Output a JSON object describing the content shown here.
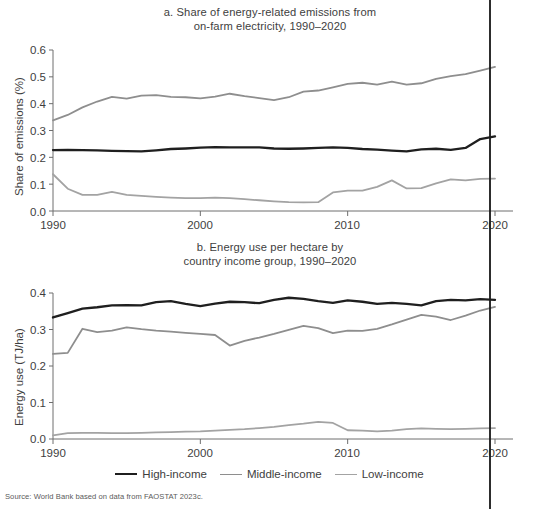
{
  "figure": {
    "source_note": "Source: World Bank based on data from FAOSTAT 2023c.",
    "colors": {
      "high_income": "#1f1f1f",
      "middle_income": "#8e8e8e",
      "low_income": "#a3a3a3",
      "axis": "#6e6e6e",
      "text": "#3e3e3e",
      "background": "#ffffff"
    }
  },
  "legend": {
    "position": "bottom-center",
    "items": [
      {
        "label": "High-income",
        "color": "#1f1f1f"
      },
      {
        "label": "Middle-income",
        "color": "#8e8e8e"
      },
      {
        "label": "Low-income",
        "color": "#a3a3a3"
      }
    ]
  },
  "panel_a": {
    "title_line1": "a. Share of energy-related emissions from",
    "title_line2": "on-farm electricity, 1990–2020",
    "ylabel": "Share of emissions (%)",
    "yticks": [
      "0.6",
      "0.5",
      "0.4",
      "0.3",
      "0.2",
      "0.1",
      "0.0"
    ],
    "xticks": [
      "1990",
      "2000",
      "2010",
      "2020"
    ]
  },
  "panel_b": {
    "title_line1": "b. Energy use per hectare by",
    "title_line2": "country income group, 1990–2020",
    "ylabel": "Energy use (TJ/ha)",
    "yticks": [
      "0.4",
      "0.3",
      "0.2",
      "0.1",
      "0.0"
    ],
    "xticks": [
      "1990",
      "2000",
      "2010",
      "2020"
    ]
  },
  "chart_data": [
    {
      "id": "panel_a",
      "type": "line",
      "title": "a. Share of energy-related emissions from on-farm electricity, 1990–2020",
      "xlabel": "",
      "ylabel": "Share of emissions (%)",
      "xlim": [
        1990,
        2020
      ],
      "ylim": [
        0.0,
        0.6
      ],
      "ytick_values": [
        0.0,
        0.1,
        0.2,
        0.3,
        0.4,
        0.5,
        0.6
      ],
      "xtick_values": [
        1990,
        2000,
        2010,
        2020
      ],
      "grid": false,
      "legend": "bottom-center (shared)",
      "x": [
        1990,
        1991,
        1992,
        1993,
        1994,
        1995,
        1996,
        1997,
        1998,
        1999,
        2000,
        2001,
        2002,
        2003,
        2004,
        2005,
        2006,
        2007,
        2008,
        2009,
        2010,
        2011,
        2012,
        2013,
        2014,
        2015,
        2016,
        2017,
        2018,
        2019,
        2020
      ],
      "series": [
        {
          "name": "High-income",
          "color": "#1f1f1f",
          "values": [
            0.227,
            0.228,
            0.227,
            0.226,
            0.224,
            0.223,
            0.222,
            0.226,
            0.231,
            0.233,
            0.236,
            0.238,
            0.237,
            0.237,
            0.237,
            0.233,
            0.232,
            0.233,
            0.235,
            0.237,
            0.235,
            0.231,
            0.229,
            0.225,
            0.222,
            0.23,
            0.232,
            0.228,
            0.235,
            0.268,
            0.278
          ]
        },
        {
          "name": "Middle-income",
          "color": "#8e8e8e",
          "values": [
            0.338,
            0.358,
            0.386,
            0.408,
            0.425,
            0.419,
            0.43,
            0.432,
            0.425,
            0.424,
            0.42,
            0.426,
            0.437,
            0.428,
            0.421,
            0.413,
            0.424,
            0.445,
            0.449,
            0.461,
            0.474,
            0.478,
            0.471,
            0.482,
            0.471,
            0.476,
            0.492,
            0.503,
            0.51,
            0.523,
            0.537
          ]
        },
        {
          "name": "Low-income",
          "color": "#a3a3a3",
          "values": [
            0.137,
            0.083,
            0.06,
            0.06,
            0.071,
            0.06,
            0.056,
            0.053,
            0.05,
            0.048,
            0.048,
            0.05,
            0.048,
            0.044,
            0.04,
            0.036,
            0.033,
            0.032,
            0.033,
            0.069,
            0.076,
            0.076,
            0.09,
            0.114,
            0.084,
            0.085,
            0.103,
            0.118,
            0.114,
            0.12,
            0.121
          ]
        }
      ]
    },
    {
      "id": "panel_b",
      "type": "line",
      "title": "b. Energy use per hectare by country income group, 1990–2020",
      "xlabel": "",
      "ylabel": "Energy use (TJ/ha)",
      "xlim": [
        1990,
        2020
      ],
      "ylim": [
        0.0,
        0.4
      ],
      "ytick_values": [
        0.0,
        0.1,
        0.2,
        0.3,
        0.4
      ],
      "xtick_values": [
        1990,
        2000,
        2010,
        2020
      ],
      "grid": false,
      "legend": "bottom-center (shared)",
      "x": [
        1990,
        1991,
        1992,
        1993,
        1994,
        1995,
        1996,
        1997,
        1998,
        1999,
        2000,
        2001,
        2002,
        2003,
        2004,
        2005,
        2006,
        2007,
        2008,
        2009,
        2010,
        2011,
        2012,
        2013,
        2014,
        2015,
        2016,
        2017,
        2018,
        2019,
        2020
      ],
      "series": [
        {
          "name": "High-income",
          "color": "#1f1f1f",
          "values": [
            0.333,
            0.345,
            0.357,
            0.361,
            0.366,
            0.367,
            0.366,
            0.375,
            0.378,
            0.37,
            0.364,
            0.371,
            0.376,
            0.375,
            0.372,
            0.381,
            0.387,
            0.384,
            0.378,
            0.373,
            0.38,
            0.376,
            0.37,
            0.373,
            0.37,
            0.366,
            0.378,
            0.381,
            0.38,
            0.383,
            0.381
          ]
        },
        {
          "name": "Middle-income",
          "color": "#8e8e8e",
          "values": [
            0.233,
            0.236,
            0.302,
            0.293,
            0.297,
            0.306,
            0.301,
            0.297,
            0.294,
            0.291,
            0.288,
            0.285,
            0.256,
            0.269,
            0.278,
            0.288,
            0.299,
            0.31,
            0.304,
            0.29,
            0.297,
            0.296,
            0.302,
            0.314,
            0.327,
            0.34,
            0.335,
            0.326,
            0.338,
            0.352,
            0.362
          ]
        },
        {
          "name": "Low-income",
          "color": "#a3a3a3",
          "values": [
            0.01,
            0.016,
            0.017,
            0.017,
            0.016,
            0.016,
            0.017,
            0.018,
            0.019,
            0.02,
            0.021,
            0.023,
            0.025,
            0.027,
            0.03,
            0.033,
            0.038,
            0.042,
            0.047,
            0.044,
            0.024,
            0.023,
            0.021,
            0.023,
            0.027,
            0.029,
            0.028,
            0.027,
            0.028,
            0.029,
            0.03
          ]
        }
      ]
    }
  ]
}
